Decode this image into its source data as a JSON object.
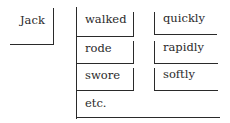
{
  "diagram": {
    "subject": "Jack",
    "verbs": [
      "walked",
      "rode",
      "swore",
      "etc."
    ],
    "adverbs": [
      "quickly",
      "rapidly",
      "softly"
    ],
    "line_color": "#2a2a2a"
  }
}
